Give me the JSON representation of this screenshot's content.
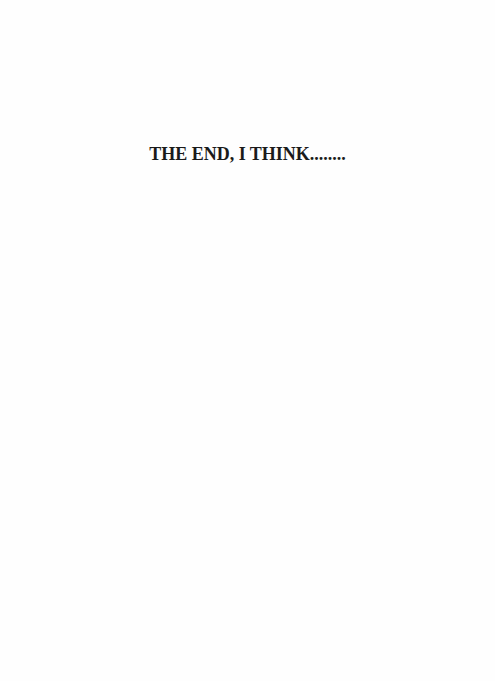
{
  "document": {
    "heading": "THE END, I THINK........"
  }
}
